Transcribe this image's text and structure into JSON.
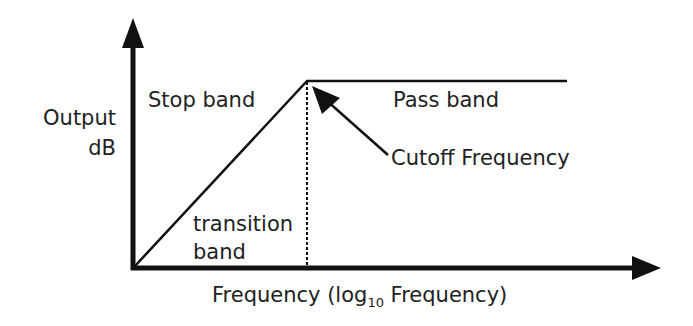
{
  "diagram": {
    "y_axis": {
      "label_line1": "Output",
      "label_line2": "dB"
    },
    "x_axis": {
      "label_prefix": "Frequency (log",
      "label_subscript": "10",
      "label_suffix": " Frequency)"
    },
    "regions": {
      "stop_band": "Stop band",
      "pass_band": "Pass band",
      "transition_line1": "transition",
      "transition_line2": "band"
    },
    "annotations": {
      "cutoff": "Cutoff Frequency"
    },
    "colors": {
      "line": "#111111",
      "text": "#222222",
      "background": "#ffffff"
    }
  }
}
